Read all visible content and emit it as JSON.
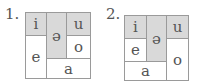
{
  "diagrams": [
    {
      "number": "1.",
      "cells": {
        "i": "i",
        "schwa": "ə",
        "u": "u",
        "e": "e",
        "o": "o",
        "a": "a"
      }
    },
    {
      "number": "2.",
      "cells": {
        "i": "i",
        "schwa": "ə",
        "u": "u",
        "e": "e",
        "o": "o",
        "a": "a"
      }
    }
  ],
  "colors": {
    "shaded": "#d9d9d9",
    "border": "#9a9a9a",
    "text": "#555555"
  }
}
